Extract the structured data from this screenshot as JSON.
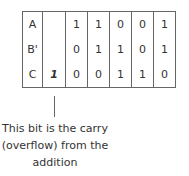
{
  "table": {
    "rows": [
      {
        "label": "A",
        "carry": "",
        "bits": [
          "1",
          "1",
          "0",
          "0",
          "1"
        ]
      },
      {
        "label": "B'",
        "carry": "",
        "bits": [
          "0",
          "1",
          "1",
          "0",
          "1"
        ]
      },
      {
        "label": "C",
        "carry": "1",
        "bits": [
          "0",
          "0",
          "1",
          "1",
          "0"
        ]
      }
    ]
  },
  "annotation": {
    "lines": [
      "This bit is the carry",
      "(overflow) from the",
      "addition"
    ]
  }
}
